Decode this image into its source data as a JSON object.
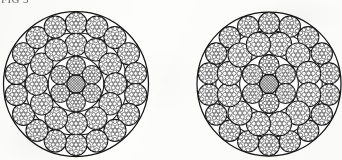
{
  "document": {
    "caption_partial": "FIG 3",
    "background_color": "#fdfdfc",
    "ink_color": "#151515",
    "width": 342,
    "height": 160
  },
  "figure": {
    "type": "technical-line-drawing",
    "view_count": 2
  },
  "chart_data": {
    "type": "diagram",
    "subtitle": "Two multi-strand steel wire rope constructions shown in section",
    "xlabel": "",
    "ylabel": "",
    "grid": false,
    "legend": "none",
    "ropes": [
      {
        "name": "rope-left",
        "label": "Left rope cross-section",
        "center_x": 75.5,
        "center_y": 84.0,
        "outer_radius": 72.5,
        "outline_stroke": "#151515",
        "core": {
          "name": "core-hatched",
          "radius": 9.2,
          "fill_pattern": "cross-hatch",
          "hatch_spacing": 1.9,
          "hatch_color": "#111111"
        },
        "rings": [
          {
            "name": "inner-ring",
            "strand_count": 6,
            "orbit_radius": 18.2,
            "strand_radius": 9.4,
            "start_angle_deg": -90,
            "guide_circle_radius": 27.8,
            "wires": {
              "center": 1,
              "inner_ring": 6,
              "outer_ring": 12
            }
          },
          {
            "name": "middle-ring",
            "strand_count": 12,
            "orbit_radius": 39.5,
            "strand_radius": 11.2,
            "start_angle_deg": -90,
            "guide_circle_radius": 51.2,
            "wires": {
              "center": 1,
              "inner_ring": 6,
              "outer_ring": 12
            }
          },
          {
            "name": "outer-ring",
            "strand_count": 18,
            "orbit_radius": 60.6,
            "strand_radius": 11.0,
            "start_angle_deg": -90,
            "guide_circle_radius": 72.5,
            "wires": {
              "center": 1,
              "inner_ring": 6,
              "outer_ring": 12
            }
          }
        ]
      },
      {
        "name": "rope-right",
        "label": "Right rope cross-section",
        "center_x": 268.5,
        "center_y": 84.0,
        "outer_radius": 72.0,
        "outline_stroke": "#151515",
        "core": {
          "name": "core-hatched",
          "radius": 9.6,
          "fill_pattern": "cross-hatch",
          "hatch_spacing": 1.9,
          "hatch_color": "#111111"
        },
        "rings": [
          {
            "name": "inner-ring",
            "strand_count": 6,
            "orbit_radius": 19.0,
            "strand_radius": 10.0,
            "start_angle_deg": -90,
            "guide_circle_radius": 29.4,
            "wires": {
              "center": 1,
              "inner_ring": 6,
              "outer_ring": 12
            }
          },
          {
            "name": "middle-ring",
            "strand_count": 12,
            "orbit_radius": 41.0,
            "strand_radius": 12.0,
            "start_angle_deg": -75,
            "guide_circle_radius": 53.2,
            "wires": {
              "center": 1,
              "inner_ring": 6,
              "outer_ring": 12
            }
          },
          {
            "name": "outer-ring",
            "strand_count": 18,
            "orbit_radius": 61.0,
            "strand_radius": 10.6,
            "start_angle_deg": -90,
            "guide_circle_radius": 72.0,
            "wires": {
              "center": 1,
              "inner_ring": 6,
              "outer_ring": 12
            }
          }
        ]
      }
    ]
  }
}
